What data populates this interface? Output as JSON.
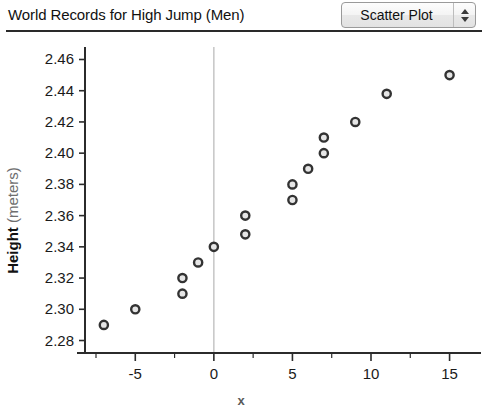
{
  "header": {
    "title": "World Records for High Jump (Men)",
    "plot_type_selector": {
      "value": "Scatter Plot",
      "up_arrow": "stepper-up-arrow",
      "down_arrow": "stepper-down-arrow"
    }
  },
  "chart_data": {
    "type": "scatter",
    "title": "World Records for High Jump (Men)",
    "xlabel": "x",
    "ylabel": "Height (meters)",
    "ylabel_bold_part": "Height",
    "ylabel_light_part": "(meters)",
    "xlim": [
      -8.2,
      17.0
    ],
    "ylim": [
      2.272,
      2.468
    ],
    "xticks": [
      -5,
      0,
      5,
      10,
      15
    ],
    "xtick_labels": [
      "-5",
      "0",
      "5",
      "10",
      "15"
    ],
    "xticks_minor": [
      -7.5,
      -2.5,
      2.5,
      7.5,
      12.5
    ],
    "yticks": [
      2.28,
      2.3,
      2.32,
      2.34,
      2.36,
      2.38,
      2.4,
      2.42,
      2.44,
      2.46
    ],
    "ytick_labels": [
      "2.28",
      "2.30",
      "2.32",
      "2.34",
      "2.36",
      "2.38",
      "2.40",
      "2.42",
      "2.44",
      "2.46"
    ],
    "grid": false,
    "zero_gridline": true,
    "zero_gridline_color": "#bcbcbc",
    "marker_style": "open-circle",
    "marker_fill": "#e6e6e6",
    "marker_edge": "#333333",
    "points": [
      {
        "x": -7,
        "y": 2.29
      },
      {
        "x": -5,
        "y": 2.3
      },
      {
        "x": -2,
        "y": 2.31
      },
      {
        "x": -2,
        "y": 2.32
      },
      {
        "x": -1,
        "y": 2.33
      },
      {
        "x": 0,
        "y": 2.34
      },
      {
        "x": 2,
        "y": 2.348
      },
      {
        "x": 2,
        "y": 2.36
      },
      {
        "x": 5,
        "y": 2.37
      },
      {
        "x": 5,
        "y": 2.38
      },
      {
        "x": 6,
        "y": 2.39
      },
      {
        "x": 7,
        "y": 2.4
      },
      {
        "x": 7,
        "y": 2.41
      },
      {
        "x": 9,
        "y": 2.42
      },
      {
        "x": 11,
        "y": 2.438
      },
      {
        "x": 15,
        "y": 2.45
      }
    ]
  }
}
